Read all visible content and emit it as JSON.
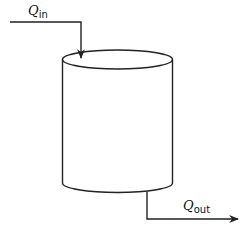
{
  "diagram": {
    "type": "tank-flow-schematic",
    "inflow": {
      "symbol": "Q",
      "subscript": "in"
    },
    "outflow": {
      "symbol": "Q",
      "subscript": "out"
    },
    "colors": {
      "stroke": "#222222",
      "background": "#ffffff"
    }
  }
}
